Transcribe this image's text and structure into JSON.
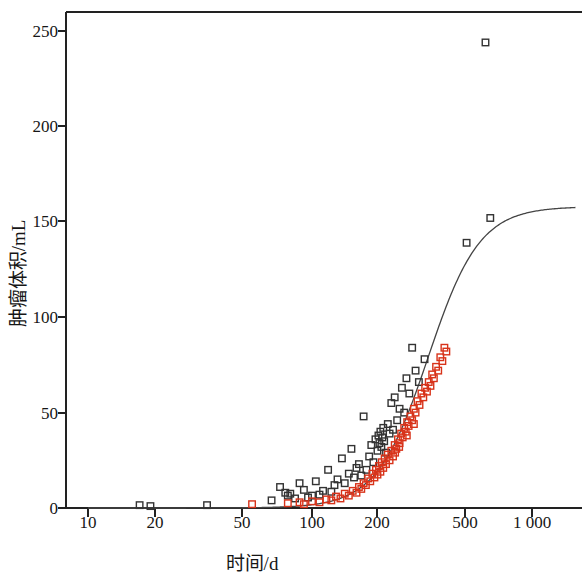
{
  "chart_data": {
    "type": "scatter",
    "title": "",
    "xlabel": "时间/d",
    "ylabel": "肿瘤体积/mL",
    "xscale": "log",
    "yscale": "linear",
    "xlim": [
      9.2,
      1500
    ],
    "ylim": [
      -8,
      262
    ],
    "xticks": [
      10,
      20,
      50,
      100,
      200,
      500,
      1000
    ],
    "xtick_labels": [
      "10",
      "20",
      "50",
      "100",
      "200",
      "500",
      "1 000"
    ],
    "yticks": [
      0,
      50,
      100,
      150,
      200,
      250
    ],
    "ytick_labels": [
      "0",
      "50",
      "100",
      "150",
      "200",
      "250"
    ],
    "grid": false,
    "legend": "none",
    "marker": "open-square",
    "series": [
      {
        "name": "black-squares",
        "color": "#333333",
        "points": [
          [
            17.0,
            1.5
          ],
          [
            19.0,
            1.0
          ],
          [
            34.0,
            1.5
          ],
          [
            66.0,
            4.0
          ],
          [
            72.0,
            11.0
          ],
          [
            76.0,
            8.0
          ],
          [
            78.0,
            6.5
          ],
          [
            80.0,
            7.5
          ],
          [
            84.0,
            5.0
          ],
          [
            88.0,
            13.0
          ],
          [
            92.0,
            9.5
          ],
          [
            96.0,
            5.5
          ],
          [
            100.0,
            6.5
          ],
          [
            104.0,
            14.0
          ],
          [
            108.0,
            7.0
          ],
          [
            112.0,
            9.0
          ],
          [
            118.0,
            20.0
          ],
          [
            122.0,
            8.5
          ],
          [
            126.0,
            12.0
          ],
          [
            130.0,
            15.0
          ],
          [
            136.0,
            26.0
          ],
          [
            140.0,
            13.0
          ],
          [
            146.0,
            18.0
          ],
          [
            150.0,
            31.0
          ],
          [
            154.0,
            16.0
          ],
          [
            158.0,
            21.0
          ],
          [
            162.0,
            23.0
          ],
          [
            166.0,
            17.0
          ],
          [
            170.0,
            48.0
          ],
          [
            175.0,
            20.0
          ],
          [
            180.0,
            27.0
          ],
          [
            184.0,
            33.0
          ],
          [
            188.0,
            24.0
          ],
          [
            192.0,
            36.0
          ],
          [
            196.0,
            30.0
          ],
          [
            198.0,
            38.0
          ],
          [
            200.0,
            34.0
          ],
          [
            202.0,
            40.0
          ],
          [
            204.0,
            32.0
          ],
          [
            206.0,
            37.0
          ],
          [
            208.0,
            42.0
          ],
          [
            210.0,
            35.0
          ],
          [
            214.0,
            29.0
          ],
          [
            218.0,
            44.0
          ],
          [
            222.0,
            39.0
          ],
          [
            226.0,
            55.0
          ],
          [
            230.0,
            41.0
          ],
          [
            234.0,
            58.0
          ],
          [
            240.0,
            46.0
          ],
          [
            246.0,
            52.0
          ],
          [
            252.0,
            63.0
          ],
          [
            258.0,
            50.0
          ],
          [
            264.0,
            68.0
          ],
          [
            272.0,
            60.0
          ],
          [
            280.0,
            84.0
          ],
          [
            290.0,
            72.0
          ],
          [
            300.0,
            66.0
          ],
          [
            318.0,
            78.0
          ],
          [
            490.0,
            139.0
          ],
          [
            625.0,
            152.0
          ],
          [
            595.0,
            244.0
          ]
        ]
      },
      {
        "name": "red-squares",
        "color": "#d8331a",
        "points": [
          [
            54.0,
            2.0
          ],
          [
            78.0,
            2.5
          ],
          [
            88.0,
            3.0
          ],
          [
            92.0,
            2.0
          ],
          [
            100.0,
            3.5
          ],
          [
            108.0,
            3.0
          ],
          [
            116.0,
            4.5
          ],
          [
            122.0,
            4.0
          ],
          [
            128.0,
            6.0
          ],
          [
            134.0,
            5.0
          ],
          [
            140.0,
            7.5
          ],
          [
            146.0,
            6.5
          ],
          [
            152.0,
            9.0
          ],
          [
            158.0,
            8.0
          ],
          [
            162.0,
            11.0
          ],
          [
            166.0,
            10.0
          ],
          [
            170.0,
            13.0
          ],
          [
            174.0,
            12.0
          ],
          [
            178.0,
            15.5
          ],
          [
            182.0,
            14.0
          ],
          [
            186.0,
            18.0
          ],
          [
            190.0,
            16.0
          ],
          [
            193.0,
            20.0
          ],
          [
            196.0,
            17.5
          ],
          [
            199.0,
            22.0
          ],
          [
            202.0,
            19.0
          ],
          [
            205.0,
            24.0
          ],
          [
            208.0,
            21.0
          ],
          [
            211.0,
            26.0
          ],
          [
            214.0,
            23.0
          ],
          [
            218.0,
            28.0
          ],
          [
            222.0,
            25.0
          ],
          [
            226.0,
            30.0
          ],
          [
            230.0,
            27.0
          ],
          [
            234.0,
            33.0
          ],
          [
            238.0,
            31.0
          ],
          [
            242.0,
            36.0
          ],
          [
            246.0,
            34.0
          ],
          [
            250.0,
            39.0
          ],
          [
            254.0,
            37.0
          ],
          [
            258.0,
            42.0
          ],
          [
            262.0,
            40.0
          ],
          [
            266.0,
            45.0
          ],
          [
            270.0,
            43.0
          ],
          [
            275.0,
            48.0
          ],
          [
            280.0,
            46.0
          ],
          [
            285.0,
            52.0
          ],
          [
            290.0,
            50.0
          ],
          [
            296.0,
            56.0
          ],
          [
            302.0,
            54.0
          ],
          [
            308.0,
            60.0
          ],
          [
            314.0,
            58.0
          ],
          [
            320.0,
            63.0
          ],
          [
            326.0,
            61.0
          ],
          [
            332.0,
            66.0
          ],
          [
            338.0,
            64.0
          ],
          [
            344.0,
            70.0
          ],
          [
            350.0,
            68.0
          ],
          [
            358.0,
            74.0
          ],
          [
            366.0,
            72.0
          ],
          [
            374.0,
            79.0
          ],
          [
            382.0,
            77.0
          ],
          [
            390.0,
            84.0
          ],
          [
            398.0,
            82.0
          ],
          [
            235.0,
            29.0
          ],
          [
            245.0,
            32.0
          ],
          [
            265.0,
            38.0
          ],
          [
            285.0,
            44.0
          ]
        ]
      }
    ],
    "fit_curve": {
      "name": "gompertz-fit",
      "color": "#444444",
      "asymptote": 158.0,
      "description": "sigmoid growth curve plateauing at ~158 mL"
    }
  }
}
